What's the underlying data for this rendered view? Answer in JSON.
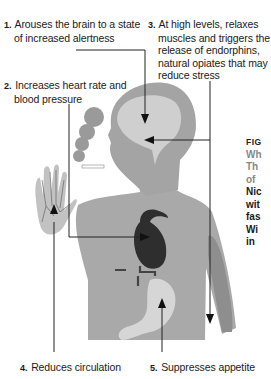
{
  "callouts": [
    {
      "number": "1.",
      "text": "Arouses the brain to a state of increased alertness"
    },
    {
      "number": "2.",
      "text": "Increases heart rate and blood pressure"
    },
    {
      "number": "3.",
      "text": "At high levels, relaxes muscles and triggers the release of endorphins, natural opiates that may reduce stress"
    },
    {
      "number": "4.",
      "text": "Reduces circulation"
    },
    {
      "number": "5.",
      "text": "Suppresses appetite"
    }
  ],
  "figure_caption": {
    "figno": "FIG",
    "title_lines": [
      "Wh",
      "Th",
      "of"
    ],
    "body_lines": [
      "Nic",
      "wit",
      "fas",
      "Wi",
      "in"
    ]
  },
  "colors": {
    "body": "#a9a9a9",
    "head_outer": "#a4a4a4",
    "brain": "#cfcfcf",
    "heart": "#2e2e2e",
    "stomach": "#d6d6d6",
    "arm_muscle": "#8e8e8e",
    "smoke": "#9a9a9a",
    "hand": "#c2c2c2",
    "lines": "#222222"
  }
}
